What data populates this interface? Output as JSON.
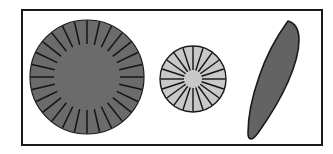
{
  "figure": {
    "title": "Plant structure diagram: two radial discs and one leaf",
    "background_color": "#ffffff",
    "frame": {
      "label": "figure-border",
      "stroke_color": "#1a1a1a",
      "stroke_width": 2,
      "x": 22,
      "y": 10,
      "width": 300,
      "height": 135
    },
    "shapes": [
      {
        "id": "large-disc",
        "label": "Large radial disc",
        "type": "radial-disc",
        "fill_color": "#6b6b6b",
        "outline_color": "#1a1a1a",
        "outline_width": 1.2,
        "spoke_color": "#141414",
        "spoke_width": 1.5,
        "center_x": 87,
        "center_y": 77,
        "radius": 57,
        "inner_radius": 33,
        "spoke_count": 28,
        "spoke_start_angle": -90
      },
      {
        "id": "small-disc",
        "label": "Small radial disc",
        "type": "radial-disc",
        "fill_color": "#c8c8c8",
        "outline_color": "#1a1a1a",
        "outline_width": 1.4,
        "spoke_color": "#141414",
        "spoke_width": 1.4,
        "center_x": 193,
        "center_y": 79,
        "radius": 33,
        "inner_radius": 9,
        "spoke_count": 20,
        "spoke_start_angle": -90
      },
      {
        "id": "leaf",
        "label": "Leaf silhouette",
        "type": "leaf",
        "fill_color": "#636363",
        "outline_color": "#1a1a1a",
        "outline_width": 1.6,
        "tip_x": 288,
        "tip_y": 21,
        "base_x": 248,
        "base_y": 139,
        "path": "M 288 21 C 277 36 266 56 259 77 C 252 97 248 117 248 133 C 248 137 249 139 251 139 C 253 139 255 137 258 133 C 268 119 280 100 288 82 C 295 66 299 50 299 40 C 299 30 295 23 288 21 Z"
      }
    ]
  }
}
